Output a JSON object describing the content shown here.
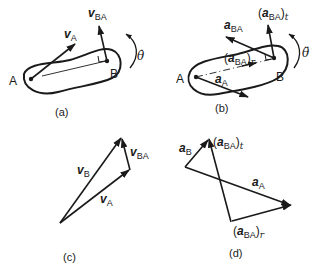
{
  "figure": {
    "panels": [
      {
        "id": "a",
        "caption": "(a)",
        "points": {
          "A": "A",
          "B": "B"
        },
        "vectors": [
          {
            "name": "v_A",
            "base": "v",
            "subscript": "A"
          },
          {
            "name": "v_BA",
            "base": "v",
            "subscript": "BA"
          }
        ],
        "rotation_label": "θ̇"
      },
      {
        "id": "b",
        "caption": "(b)",
        "points": {
          "A": "A",
          "B": "B"
        },
        "vectors": [
          {
            "name": "a_A",
            "base": "a",
            "subscript": "A"
          },
          {
            "name": "a_BA",
            "base": "a",
            "subscript": "BA"
          },
          {
            "name": "(a_BA)_t",
            "open": "(",
            "base": "a",
            "subscript": "BA",
            "close": ")",
            "outer_sub": "t"
          },
          {
            "name": "(a_BA)_r",
            "open": "(",
            "base": "a",
            "subscript": "BA",
            "close": ")",
            "outer_sub": "r"
          }
        ],
        "rotation_label": "θ̈"
      },
      {
        "id": "c",
        "caption": "(c)",
        "vectors": [
          {
            "name": "v_B",
            "base": "v",
            "subscript": "B"
          },
          {
            "name": "v_A",
            "base": "v",
            "subscript": "A"
          },
          {
            "name": "v_BA",
            "base": "v",
            "subscript": "BA"
          }
        ]
      },
      {
        "id": "d",
        "caption": "(d)",
        "vectors": [
          {
            "name": "a_B",
            "base": "a",
            "subscript": "B"
          },
          {
            "name": "a_A",
            "base": "a",
            "subscript": "A"
          },
          {
            "name": "(a_BA)_t",
            "open": "(",
            "base": "a",
            "subscript": "BA",
            "close": ")",
            "outer_sub": "t"
          },
          {
            "name": "(a_BA)_r",
            "open": "(",
            "base": "a",
            "subscript": "BA",
            "close": ")",
            "outer_sub": "r"
          }
        ]
      }
    ]
  },
  "colors": {
    "ink": "#1a1a1a",
    "background": "#ffffff"
  }
}
